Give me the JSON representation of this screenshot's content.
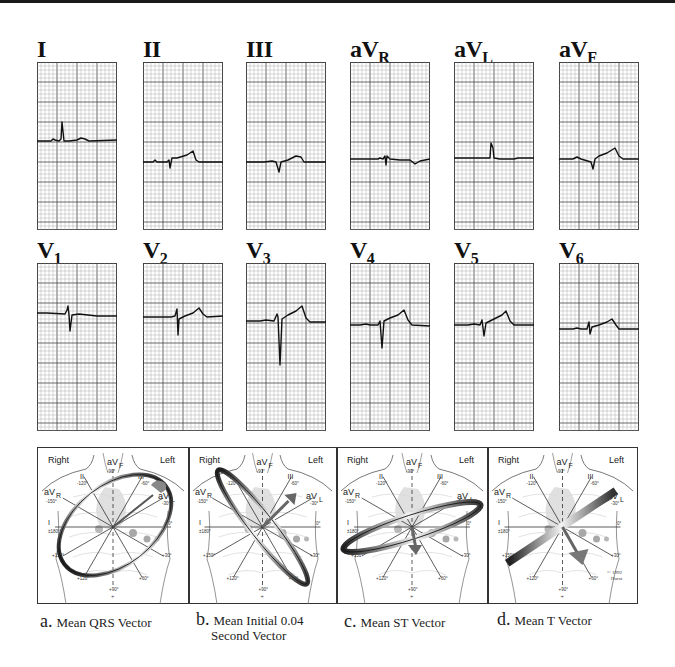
{
  "figure": {
    "type": "12-lead ECG with hexaxial vector diagrams",
    "grid": {
      "minor_color": "#9a9a9a",
      "major_color": "#444444",
      "trace_color": "#111111"
    },
    "limb_leads": [
      {
        "id": "I",
        "label": "I",
        "sub": ""
      },
      {
        "id": "II",
        "label": "II",
        "sub": ""
      },
      {
        "id": "III",
        "label": "III",
        "sub": ""
      },
      {
        "id": "aVR",
        "label": "aV",
        "sub": "R"
      },
      {
        "id": "aVL",
        "label": "aV",
        "sub": "L"
      },
      {
        "id": "aVF",
        "label": "aV",
        "sub": "F"
      }
    ],
    "precordial_leads": [
      {
        "id": "V1",
        "label": "V",
        "sub": "1"
      },
      {
        "id": "V2",
        "label": "V",
        "sub": "2"
      },
      {
        "id": "V3",
        "label": "V",
        "sub": "3"
      },
      {
        "id": "V4",
        "label": "V",
        "sub": "4"
      },
      {
        "id": "V5",
        "label": "V",
        "sub": "5"
      },
      {
        "id": "V6",
        "label": "V",
        "sub": "6"
      }
    ],
    "vector_panels": [
      {
        "id": "a",
        "letter": "a.",
        "caption_line1": "Mean QRS Vector",
        "caption_line2": "",
        "side_right": "Right",
        "side_left": "Left"
      },
      {
        "id": "b",
        "letter": "b.",
        "caption_line1": "Mean Initial 0.04",
        "caption_line2": "Second Vector",
        "side_right": "Right",
        "side_left": "Left"
      },
      {
        "id": "c",
        "letter": "c.",
        "caption_line1": "Mean ST Vector",
        "caption_line2": "",
        "side_right": "Right",
        "side_left": "Left"
      },
      {
        "id": "d",
        "letter": "d.",
        "caption_line1": "Mean T Vector",
        "caption_line2": "",
        "side_right": "Right",
        "side_left": "Left",
        "copyright": "© 1992 Hurst"
      }
    ],
    "axis_labels": {
      "I": "I",
      "II": "II",
      "III": "III",
      "aVR": "aV",
      "aVR_sub": "R",
      "aVL": "aV",
      "aVL_sub": "L",
      "aVF": "aV",
      "aVF_sub": "F",
      "deg_0": "0°",
      "deg_m30": "-30°",
      "deg_m60": "-60°",
      "deg_m90": "-90°",
      "deg_m120": "-120°",
      "deg_m150": "-150°",
      "deg_180": "±180°",
      "deg_p150": "+150°",
      "deg_p120": "+120°",
      "deg_p90": "+90°",
      "deg_p60": "+60°",
      "deg_p30": "+30°"
    }
  }
}
